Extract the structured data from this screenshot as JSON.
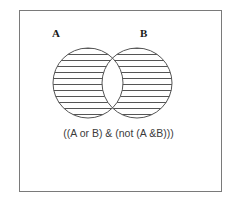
{
  "figure": {
    "type": "venn-diagram",
    "operation": "symmetric-difference",
    "border_color": "#7a7a7a",
    "background_color": "#ffffff",
    "stroke_color": "#555555",
    "hatch_color": "#555555",
    "labels": {
      "set_a": "A",
      "set_b": "B"
    },
    "caption": "((A or B) & (not (A &B)))",
    "circles": [
      {
        "name": "A",
        "cx": 88,
        "cy": 83,
        "r": 35
      },
      {
        "name": "B",
        "cx": 137,
        "cy": 83,
        "r": 35
      }
    ],
    "hatching": {
      "orientation": "horizontal",
      "line_count": 11,
      "spacing_px": 6,
      "regions_filled": [
        "A only",
        "B only"
      ],
      "regions_empty": [
        "A and B"
      ]
    }
  }
}
